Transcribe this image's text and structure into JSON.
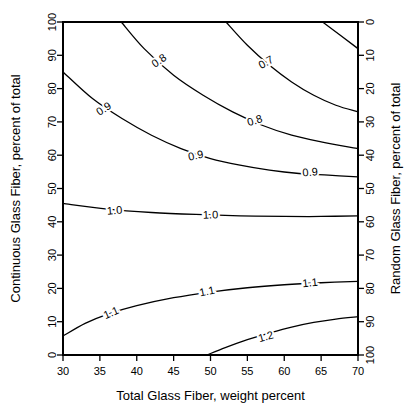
{
  "chart_data": {
    "type": "line",
    "title": "",
    "subtitle": "",
    "xlabel": "Total Glass Fiber, weight percent",
    "ylabel": "Continuous Glass Fiber, percent of total",
    "y2label": "Random Glass Fiber, percent of total",
    "xlim": [
      30,
      70
    ],
    "ylim": [
      0,
      100
    ],
    "y2lim": [
      100,
      0
    ],
    "xticks": [
      30,
      35,
      40,
      45,
      50,
      55,
      60,
      65,
      70
    ],
    "yticks": [
      0,
      10,
      20,
      30,
      40,
      50,
      60,
      70,
      80,
      90,
      100
    ],
    "y2ticks": [
      0,
      10,
      20,
      30,
      40,
      50,
      60,
      70,
      80,
      90,
      100
    ],
    "grid": false,
    "legend": "none",
    "chart_kind": "contour",
    "contours": [
      {
        "level": "0.6",
        "labels": [],
        "points": [
          [
            65.2,
            100
          ],
          [
            70,
            92
          ]
        ]
      },
      {
        "level": "0.7",
        "labels": [
          "0.7"
        ],
        "points": [
          [
            52.1,
            100
          ],
          [
            55,
            93
          ],
          [
            58,
            87
          ],
          [
            61,
            82
          ],
          [
            64,
            78
          ],
          [
            67,
            75
          ],
          [
            70,
            73
          ]
        ]
      },
      {
        "level": "0.8",
        "labels": [
          "0.8",
          "0.8"
        ],
        "points": [
          [
            37.9,
            100
          ],
          [
            41,
            92
          ],
          [
            45,
            84
          ],
          [
            49,
            78
          ],
          [
            53,
            73
          ],
          [
            57,
            69
          ],
          [
            61,
            66
          ],
          [
            65,
            64
          ],
          [
            70,
            62
          ]
        ]
      },
      {
        "level": "0.9",
        "labels": [
          "0.9",
          "0.9",
          "0.9"
        ],
        "points": [
          [
            30,
            85
          ],
          [
            34,
            77
          ],
          [
            38,
            71
          ],
          [
            42,
            66
          ],
          [
            46,
            62
          ],
          [
            50,
            59
          ],
          [
            54,
            57
          ],
          [
            58,
            55.5
          ],
          [
            62,
            54.5
          ],
          [
            66,
            54
          ],
          [
            70,
            53.5
          ]
        ]
      },
      {
        "level": "1.0",
        "labels": [
          "1.0",
          "1.0"
        ],
        "points": [
          [
            30,
            45.5
          ],
          [
            36,
            43.8
          ],
          [
            42,
            42.8
          ],
          [
            48,
            42.2
          ],
          [
            54,
            41.8
          ],
          [
            60,
            41.6
          ],
          [
            65,
            41.6
          ],
          [
            70,
            41.8
          ]
        ]
      },
      {
        "level": "1.1",
        "labels": [
          "1.1",
          "1.1",
          "1.1"
        ],
        "points": [
          [
            30,
            5.7
          ],
          [
            33,
            9.5
          ],
          [
            36,
            12.2
          ],
          [
            40,
            14.8
          ],
          [
            45,
            17.2
          ],
          [
            50,
            18.9
          ],
          [
            55,
            20.2
          ],
          [
            60,
            21.1
          ],
          [
            65,
            21.7
          ],
          [
            70,
            22.1
          ]
        ]
      },
      {
        "level": "1.2",
        "labels": [
          "1.2"
        ],
        "points": [
          [
            49.5,
            0
          ],
          [
            52,
            2.2
          ],
          [
            55,
            4.6
          ],
          [
            58,
            6.6
          ],
          [
            61,
            8.4
          ],
          [
            64,
            9.8
          ],
          [
            67,
            10.8
          ],
          [
            70,
            11.5
          ]
        ]
      }
    ],
    "contour_label_positions": [
      {
        "text": "0.8",
        "x": 43.0,
        "y": 88.5,
        "rot": -34
      },
      {
        "text": "0.7",
        "x": 57.5,
        "y": 88.0,
        "rot": -30
      },
      {
        "text": "0.9",
        "x": 35.5,
        "y": 74.0,
        "rot": -33
      },
      {
        "text": "0.8",
        "x": 56.0,
        "y": 70.5,
        "rot": -17
      },
      {
        "text": "0.9",
        "x": 48.0,
        "y": 60.0,
        "rot": -12
      },
      {
        "text": "0.9",
        "x": 63.5,
        "y": 55.0,
        "rot": -5
      },
      {
        "text": "1.0",
        "x": 37.0,
        "y": 43.5,
        "rot": -5
      },
      {
        "text": "1.0",
        "x": 50.0,
        "y": 42.2,
        "rot": -2
      },
      {
        "text": "1.1",
        "x": 36.5,
        "y": 12.8,
        "rot": -24
      },
      {
        "text": "1.1",
        "x": 49.5,
        "y": 19.2,
        "rot": -12
      },
      {
        "text": "1.1",
        "x": 63.5,
        "y": 21.8,
        "rot": -6
      },
      {
        "text": "1.2",
        "x": 57.5,
        "y": 5.6,
        "rot": -16
      }
    ]
  }
}
